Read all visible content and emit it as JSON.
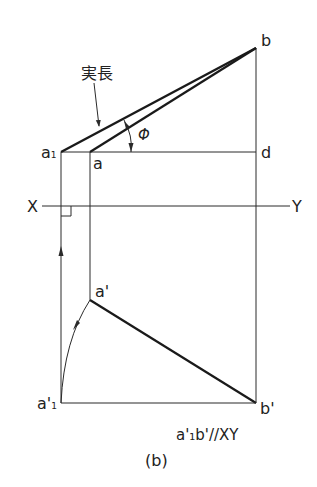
{
  "diagram": {
    "caption": "(b)",
    "note": "a'₁b'//XY",
    "labels": {
      "b": "b",
      "d": "d",
      "a1": "a",
      "a1_sub": "1",
      "a": "a",
      "a_prime": "a'",
      "a1_prime": "a'",
      "a1_prime_sub": "1",
      "b_prime": "b'",
      "x_axis": "X",
      "y_axis": "Y",
      "true_length": "実長",
      "angle": "Φ"
    },
    "points": {
      "b": [
        256,
        48
      ],
      "d": [
        256,
        152
      ],
      "a1": [
        61,
        152
      ],
      "a": [
        90,
        152
      ],
      "a_prime": [
        90,
        300
      ],
      "a1_prime": [
        61,
        403
      ],
      "b_prime": [
        256,
        403
      ]
    },
    "xy_line_y": 206,
    "colors": {
      "line": "#2a2a2a",
      "thick_line": "#1a1a1a",
      "text": "#222222"
    }
  }
}
